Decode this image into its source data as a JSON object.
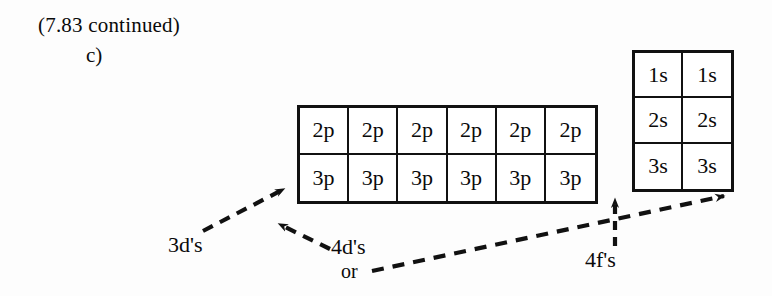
{
  "header": {
    "continued": "(7.83 continued)",
    "part": "c)"
  },
  "grids": {
    "p_block": {
      "name": "p-orbital-grid",
      "columns": 6,
      "rows": 2,
      "cells": [
        "2p",
        "2p",
        "2p",
        "2p",
        "2p",
        "2p",
        "3p",
        "3p",
        "3p",
        "3p",
        "3p",
        "3p"
      ]
    },
    "s_block": {
      "name": "s-orbital-grid",
      "columns": 2,
      "rows": 3,
      "cells": [
        "1s",
        "1s",
        "2s",
        "2s",
        "3s",
        "3s"
      ]
    }
  },
  "annotations": {
    "three_d": "3d's",
    "four_d": "4d's",
    "or": "or",
    "four_f": "4f's"
  },
  "colors": {
    "ink": "#111111",
    "paper": "#fdfdfd"
  }
}
